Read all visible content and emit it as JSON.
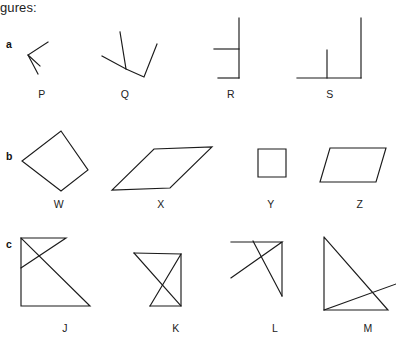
{
  "page": {
    "prompt": "gures:",
    "background_color": "#ffffff",
    "stroke_color": "#1b1b1b",
    "width": 396,
    "height": 340
  },
  "rows": [
    {
      "label": "a",
      "label_x": 6,
      "label_y": 38,
      "description": "angles and line segments",
      "figures": [
        {
          "label": "P",
          "label_x": 29,
          "label_y": 88,
          "svg_x": 18,
          "svg_y": 22,
          "svg_w": 60,
          "svg_h": 60,
          "shapes": [
            {
              "type": "polyline",
              "points": "30,20 10,33 22,44"
            },
            {
              "type": "line",
              "points": "10,33 20,52"
            }
          ]
        },
        {
          "label": "Q",
          "label_x": 112,
          "label_y": 88,
          "svg_x": 98,
          "svg_y": 22,
          "svg_w": 64,
          "svg_h": 60,
          "shapes": [
            {
              "type": "polyline",
              "points": "4,34 28,47 28,47 22,10"
            },
            {
              "type": "polyline",
              "points": "28,47 46,55 59,22"
            }
          ]
        },
        {
          "label": "R",
          "label_x": 218,
          "label_y": 88,
          "svg_x": 210,
          "svg_y": 16,
          "svg_w": 48,
          "svg_h": 66,
          "shapes": [
            {
              "type": "line",
              "points": "29,2 29,62"
            },
            {
              "type": "line",
              "points": "4,33 29,33"
            },
            {
              "type": "line",
              "points": "8,62 29,62"
            }
          ]
        },
        {
          "label": "S",
          "label_x": 317,
          "label_y": 88,
          "svg_x": 295,
          "svg_y": 16,
          "svg_w": 72,
          "svg_h": 66,
          "shapes": [
            {
              "type": "line",
              "points": "66,2 66,62"
            },
            {
              "type": "line",
              "points": "2,62 66,62"
            },
            {
              "type": "line",
              "points": "32,34 32,62"
            }
          ]
        }
      ]
    },
    {
      "label": "b",
      "label_x": 6,
      "label_y": 150,
      "description": "quadrilaterals",
      "figures": [
        {
          "label": "W",
          "label_x": 46,
          "label_y": 198,
          "svg_x": 20,
          "svg_y": 128,
          "svg_w": 72,
          "svg_h": 68,
          "shapes": [
            {
              "type": "polygon",
              "points": "41,3 68,42 41,63 2,33"
            }
          ]
        },
        {
          "label": "X",
          "label_x": 148,
          "label_y": 198,
          "svg_x": 110,
          "svg_y": 144,
          "svg_w": 104,
          "svg_h": 52,
          "shapes": [
            {
              "type": "polygon",
              "points": "44,5 102,3 60,44 2,46"
            }
          ]
        },
        {
          "label": "Y",
          "label_x": 258,
          "label_y": 198,
          "svg_x": 256,
          "svg_y": 147,
          "svg_w": 36,
          "svg_h": 36,
          "shapes": [
            {
              "type": "polygon",
              "points": "2,2 30,2 30,30 2,30"
            }
          ]
        },
        {
          "label": "Z",
          "label_x": 347,
          "label_y": 198,
          "svg_x": 318,
          "svg_y": 144,
          "svg_w": 72,
          "svg_h": 46,
          "shapes": [
            {
              "type": "polygon",
              "points": "12,4 68,4 58,38 2,38"
            }
          ]
        }
      ]
    },
    {
      "label": "c",
      "label_x": 6,
      "label_y": 238,
      "description": "intersecting triangles",
      "figures": [
        {
          "label": "J",
          "label_x": 52,
          "label_y": 322,
          "svg_x": 18,
          "svg_y": 234,
          "svg_w": 86,
          "svg_h": 80,
          "shapes": [
            {
              "type": "polyline",
              "points": "3,4 3,72 72,72 3,4"
            },
            {
              "type": "polyline",
              "points": "3,4 48,4 3,34"
            }
          ]
        },
        {
          "label": "K",
          "label_x": 163,
          "label_y": 322,
          "svg_x": 130,
          "svg_y": 248,
          "svg_w": 66,
          "svg_h": 66,
          "shapes": [
            {
              "type": "polyline",
              "points": "4,5 51,6 20,58"
            },
            {
              "type": "polyline",
              "points": "51,6 51,58 20,58"
            },
            {
              "type": "line",
              "points": "4,5 51,58"
            }
          ]
        },
        {
          "label": "L",
          "label_x": 262,
          "label_y": 322,
          "svg_x": 228,
          "svg_y": 238,
          "svg_w": 72,
          "svg_h": 76,
          "shapes": [
            {
              "type": "polyline",
              "points": "3,4 54,4 3,40"
            },
            {
              "type": "line",
              "points": "54,4 54,58"
            },
            {
              "type": "line",
              "points": "25,3 54,58"
            }
          ]
        },
        {
          "label": "M",
          "label_x": 355,
          "label_y": 322,
          "svg_x": 312,
          "svg_y": 232,
          "svg_w": 84,
          "svg_h": 82,
          "shapes": [
            {
              "type": "polyline",
              "points": "12,5 12,78 76,78 12,5"
            },
            {
              "type": "line",
              "points": "12,78 84,52"
            }
          ]
        }
      ]
    }
  ]
}
